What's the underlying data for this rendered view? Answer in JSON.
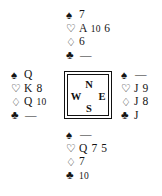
{
  "diagram": {
    "type": "bridge-hand-diagram",
    "suit_symbols": {
      "spade": "♠",
      "heart": "♡",
      "diamond": "♢",
      "club": "♣"
    },
    "suit_colors": {
      "spade": "#141414",
      "heart": "#141414",
      "diamond": "#141414",
      "club": "#141414"
    },
    "void_mark": "—",
    "compass": {
      "north": "N",
      "west": "W",
      "east": "E",
      "south": "S"
    },
    "hands": {
      "north": {
        "seat": "North",
        "spades": "7",
        "hearts": "A 10 6",
        "diamonds": "6",
        "clubs": "—"
      },
      "west": {
        "seat": "West",
        "spades": "Q",
        "hearts": "K 8",
        "diamonds": "Q 10",
        "clubs": "—"
      },
      "east": {
        "seat": "East",
        "spades": "—",
        "hearts": "J 9",
        "diamonds": "J 8",
        "clubs": "J"
      },
      "south": {
        "seat": "South",
        "spades": "—",
        "hearts": "Q 7 5",
        "diamonds": "7",
        "clubs": "10"
      }
    }
  }
}
